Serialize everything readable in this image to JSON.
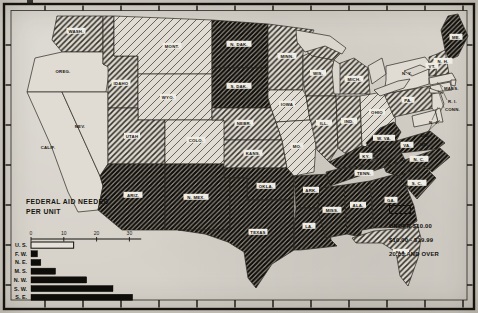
{
  "page": {
    "kind": "scanned statistical map, United States",
    "ink": "#1b1914",
    "paper": "#d6d2ca"
  },
  "map": {
    "title": "FEDERAL AID NEEDED\nPER UNIT",
    "legend": {
      "items": [
        {
          "key": "none",
          "label": "NO AID"
        },
        {
          "key": "light",
          "label": "UNDER $10.00"
        },
        {
          "key": "medium",
          "label": "$10.00 - $19.99"
        },
        {
          "key": "dark",
          "label": "20.00 AND OVER"
        }
      ]
    },
    "categories": {
      "none": "NO AID",
      "light": "UNDER $10.00",
      "medium": "$10.00 - $19.99",
      "dark": "20.00 AND OVER"
    },
    "states": [
      {
        "id": "wash",
        "label": "WASH.",
        "category": "medium"
      },
      {
        "id": "oreg",
        "label": "OREG.",
        "category": "none"
      },
      {
        "id": "calif",
        "label": "CALIF.",
        "category": "none"
      },
      {
        "id": "nev",
        "label": "NEV.",
        "category": "none"
      },
      {
        "id": "idaho",
        "label": "IDAHO",
        "category": "medium"
      },
      {
        "id": "mont",
        "label": "MONT.",
        "category": "light"
      },
      {
        "id": "wyo",
        "label": "WYO.",
        "category": "light"
      },
      {
        "id": "utah",
        "label": "UTAH",
        "category": "medium"
      },
      {
        "id": "colo",
        "label": "COLO.",
        "category": "light"
      },
      {
        "id": "ariz",
        "label": "ARIZ.",
        "category": "dark"
      },
      {
        "id": "nmex",
        "label": "N. MEX.",
        "category": "dark"
      },
      {
        "id": "ndak",
        "label": "N. DAK.",
        "category": "dark"
      },
      {
        "id": "sdak",
        "label": "S. DAK.",
        "category": "dark"
      },
      {
        "id": "nebr",
        "label": "NEBR.",
        "category": "medium"
      },
      {
        "id": "kans",
        "label": "KANS.",
        "category": "medium"
      },
      {
        "id": "okla",
        "label": "OKLA.",
        "category": "dark"
      },
      {
        "id": "texas",
        "label": "TEXAS",
        "category": "dark"
      },
      {
        "id": "minn",
        "label": "MINN.",
        "category": "medium"
      },
      {
        "id": "iowa",
        "label": "IOWA",
        "category": "light"
      },
      {
        "id": "mo",
        "label": "MO.",
        "category": "light"
      },
      {
        "id": "ark",
        "label": "ARK.",
        "category": "dark"
      },
      {
        "id": "la",
        "label": "LA.",
        "category": "dark"
      },
      {
        "id": "wis",
        "label": "WIS.",
        "category": "medium"
      },
      {
        "id": "ill",
        "label": "ILL.",
        "category": "medium"
      },
      {
        "id": "ind",
        "label": "IND.",
        "category": "medium"
      },
      {
        "id": "ohio",
        "label": "OHIO",
        "category": "light"
      },
      {
        "id": "mich",
        "label": "MICH.",
        "category": "medium"
      },
      {
        "id": "ky",
        "label": "KY.",
        "category": "dark"
      },
      {
        "id": "tenn",
        "label": "TENN.",
        "category": "dark"
      },
      {
        "id": "miss",
        "label": "MISS.",
        "category": "dark"
      },
      {
        "id": "ala",
        "label": "ALA.",
        "category": "dark"
      },
      {
        "id": "ga",
        "label": "GA.",
        "category": "dark"
      },
      {
        "id": "fla",
        "label": "FLA.",
        "category": "medium"
      },
      {
        "id": "sc",
        "label": "S. C.",
        "category": "dark"
      },
      {
        "id": "nc",
        "label": "N. C.",
        "category": "dark"
      },
      {
        "id": "va",
        "label": "VA.",
        "category": "dark"
      },
      {
        "id": "wva",
        "label": "W. VA.",
        "category": "dark"
      },
      {
        "id": "pa",
        "label": "PA.",
        "category": "medium"
      },
      {
        "id": "ny",
        "label": "N. Y.",
        "category": "none"
      },
      {
        "id": "nj",
        "label": "N. J.",
        "category": "none"
      },
      {
        "id": "del",
        "label": "DEL.",
        "category": "none"
      },
      {
        "id": "md",
        "label": "MD.",
        "category": "none"
      },
      {
        "id": "vt",
        "label": "VT.",
        "category": "medium"
      },
      {
        "id": "nh",
        "label": "N. H.",
        "category": "medium"
      },
      {
        "id": "mass",
        "label": "MASS.",
        "category": "none"
      },
      {
        "id": "ri",
        "label": "R. I.",
        "category": "none"
      },
      {
        "id": "conn",
        "label": "CONN.",
        "category": "none"
      },
      {
        "id": "me",
        "label": "ME.",
        "category": "dark"
      }
    ]
  },
  "chart_data": {
    "type": "bar",
    "orientation": "horizontal",
    "title": "FEDERAL AID NEEDED PER UNIT",
    "categories": [
      "U. S.",
      "F. W.",
      "N. E.",
      "M. S.",
      "N. W.",
      "S. W.",
      "S. E."
    ],
    "values": [
      13,
      2,
      3,
      7.5,
      17,
      25,
      31
    ],
    "bar_styles": [
      "outline",
      "solid",
      "solid",
      "solid",
      "solid",
      "solid",
      "solid"
    ],
    "x_ticks": [
      0,
      10,
      20,
      30
    ],
    "xlim": [
      0,
      33
    ],
    "grid": false,
    "legend_position": "bottom-right"
  }
}
